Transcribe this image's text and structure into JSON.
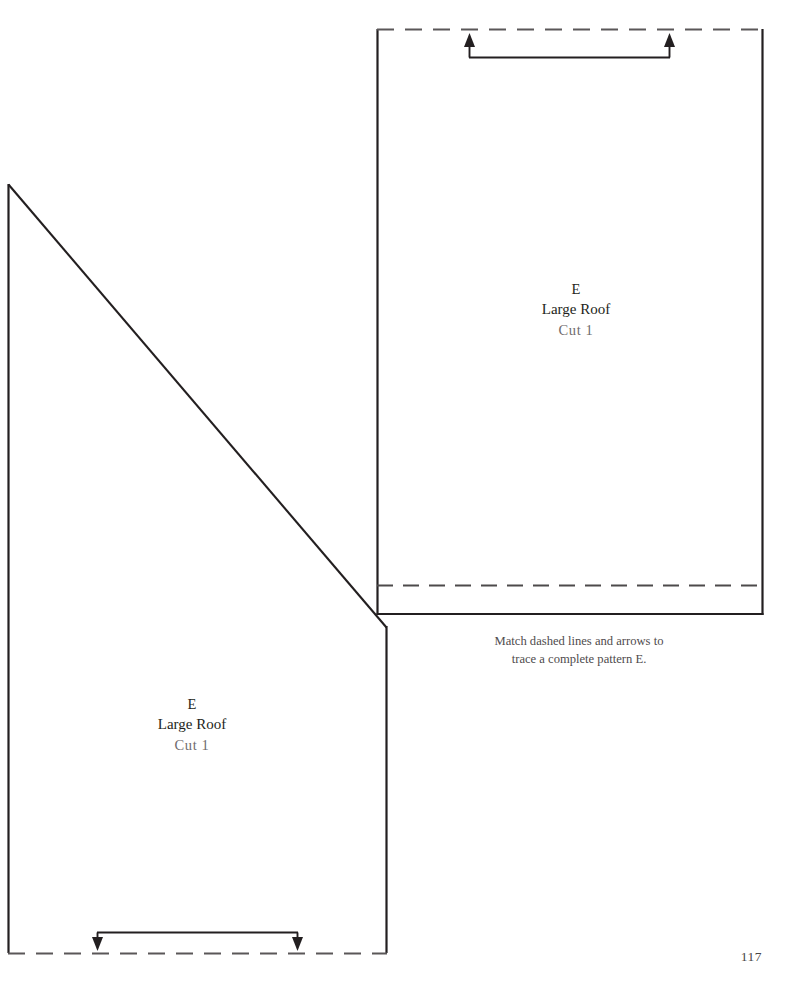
{
  "page": {
    "number": "117",
    "background_color": "#ffffff",
    "line_color": "#231f20",
    "dashed_color": "#5a5758"
  },
  "pieces": [
    {
      "id": "left-piece",
      "label": {
        "letter": "E",
        "name": "Large Roof",
        "cut": "Cut 1"
      },
      "edges": {
        "left": "solid",
        "top_right_diagonal": "solid",
        "right": "solid",
        "bottom": "dashed"
      },
      "arrows": {
        "direction": "down",
        "count": 2,
        "bracket": "horizontal"
      }
    },
    {
      "id": "right-piece",
      "label": {
        "letter": "E",
        "name": "Large Roof",
        "cut": "Cut 1"
      },
      "edges": {
        "left": "solid",
        "top": "dashed",
        "right": "solid",
        "bottom": "solid",
        "fold_line": "dashed"
      },
      "arrows": {
        "direction": "up",
        "count": 2,
        "bracket": "horizontal"
      }
    }
  ],
  "caption": {
    "line1": "Match dashed lines and arrows to",
    "line2": "trace a complete pattern E."
  }
}
